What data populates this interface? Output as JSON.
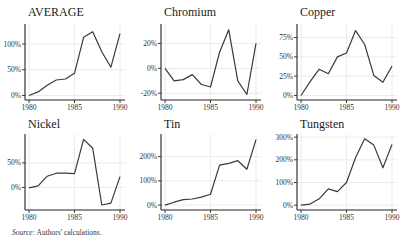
{
  "source_note": {
    "label": "Source:",
    "text": "Authors' calculations."
  },
  "chart_data": [
    {
      "type": "line",
      "title": "AVERAGE",
      "xlabel": "",
      "ylabel": "",
      "x": [
        1980,
        1981,
        1982,
        1983,
        1984,
        1985,
        1986,
        1987,
        1988,
        1989,
        1990
      ],
      "values": [
        0,
        7,
        20,
        30,
        32,
        43,
        113,
        124,
        85,
        55,
        120
      ],
      "xticks": [
        1980,
        1985,
        1990
      ],
      "yticks": [
        0,
        50,
        100
      ],
      "ytick_labels": [
        "0%",
        "50%",
        "100%"
      ],
      "ylim": [
        -3,
        135
      ],
      "grid": true
    },
    {
      "type": "line",
      "title": "Chromium",
      "xlabel": "",
      "ylabel": "",
      "x": [
        1980,
        1981,
        1982,
        1983,
        1984,
        1985,
        1986,
        1987,
        1988,
        1989,
        1990
      ],
      "values": [
        0,
        -10,
        -9,
        -5,
        -13,
        -15,
        13,
        31,
        -10,
        -21,
        20
      ],
      "xticks": [
        1980,
        1985,
        1990
      ],
      "yticks": [
        -20,
        0,
        20
      ],
      "ytick_labels": [
        "-20%",
        "0%",
        "20%"
      ],
      "ylim": [
        -23,
        34
      ],
      "grid": true
    },
    {
      "type": "line",
      "title": "Copper",
      "xlabel": "",
      "ylabel": "",
      "x": [
        1980,
        1981,
        1982,
        1983,
        1984,
        1985,
        1986,
        1987,
        1988,
        1989,
        1990
      ],
      "values": [
        0,
        18,
        34,
        28,
        50,
        55,
        84,
        66,
        26,
        17,
        38
      ],
      "xticks": [
        1980,
        1985,
        1990
      ],
      "yticks": [
        0,
        25,
        50,
        75
      ],
      "ytick_labels": [
        "0%",
        "25%",
        "50%",
        "75%"
      ],
      "ylim": [
        -2,
        90
      ],
      "grid": true
    },
    {
      "type": "line",
      "title": "Nickel",
      "xlabel": "",
      "ylabel": "",
      "x": [
        1980,
        1981,
        1982,
        1983,
        1984,
        1985,
        1986,
        1987,
        1988,
        1989,
        1990
      ],
      "values": [
        -1,
        3,
        23,
        29,
        29,
        28,
        98,
        80,
        -36,
        -32,
        22
      ],
      "xticks": [
        1980,
        1985,
        1990
      ],
      "yticks": [
        0,
        50
      ],
      "ytick_labels": [
        "0%",
        "50%"
      ],
      "ylim": [
        -40,
        105
      ],
      "grid": true
    },
    {
      "type": "line",
      "title": "Tin",
      "xlabel": "",
      "ylabel": "",
      "x": [
        1980,
        1981,
        1982,
        1983,
        1984,
        1985,
        1986,
        1987,
        1988,
        1989,
        1990
      ],
      "values": [
        0,
        12,
        22,
        25,
        33,
        45,
        165,
        172,
        183,
        148,
        270
      ],
      "xticks": [
        1980,
        1985,
        1990
      ],
      "yticks": [
        0,
        100,
        200
      ],
      "ytick_labels": [
        "0%",
        "100%",
        "200%"
      ],
      "ylim": [
        -8,
        285
      ],
      "grid": true
    },
    {
      "type": "line",
      "title": "Tungsten",
      "xlabel": "",
      "ylabel": "",
      "x": [
        1980,
        1981,
        1982,
        1983,
        1984,
        1985,
        1986,
        1987,
        1988,
        1989,
        1990
      ],
      "values": [
        0,
        5,
        28,
        72,
        60,
        100,
        210,
        293,
        265,
        165,
        268
      ],
      "xticks": [
        1980,
        1985,
        1990
      ],
      "yticks": [
        0,
        100,
        200,
        300
      ],
      "ytick_labels": [
        "0%",
        "100%",
        "200%",
        "300%"
      ],
      "ylim": [
        -8,
        305
      ],
      "grid": true
    }
  ]
}
